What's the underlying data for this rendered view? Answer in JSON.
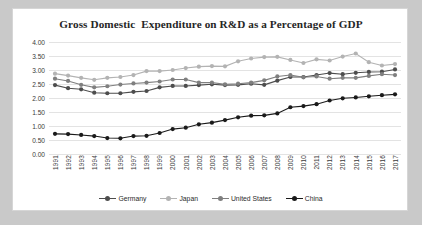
{
  "chart_data": {
    "type": "line",
    "title": "Gross Domestic  Expenditure on R&D as a Percentage of GDP",
    "xlabel": "",
    "ylabel": "",
    "ylim": [
      0,
      4
    ],
    "ytick_step": 0.5,
    "ytick_labels": [
      "4.00",
      "3.50",
      "3.00",
      "2.50",
      "2.00",
      "1.50",
      "1.00",
      "0.50",
      "0.00"
    ],
    "grid": true,
    "legend_position": "bottom",
    "categories": [
      "1991",
      "1992",
      "1993",
      "1994",
      "1995",
      "1996",
      "1997",
      "1998",
      "1999",
      "2000",
      "2001",
      "2002",
      "2003",
      "2004",
      "2005",
      "2006",
      "2007",
      "2008",
      "2009",
      "2010",
      "2011",
      "2012",
      "2013",
      "2014",
      "2015",
      "2016",
      "2017"
    ],
    "series": [
      {
        "name": "Germany",
        "color": "#4d4d4d",
        "values": [
          2.46,
          2.35,
          2.31,
          2.19,
          2.17,
          2.17,
          2.22,
          2.25,
          2.38,
          2.43,
          2.43,
          2.46,
          2.49,
          2.46,
          2.47,
          2.51,
          2.47,
          2.62,
          2.75,
          2.75,
          2.82,
          2.89,
          2.85,
          2.9,
          2.93,
          2.94,
          3.02
        ]
      },
      {
        "name": "Japan",
        "color": "#b3b3b3",
        "values": [
          2.87,
          2.8,
          2.72,
          2.65,
          2.72,
          2.75,
          2.82,
          2.96,
          2.96,
          3.0,
          3.07,
          3.12,
          3.14,
          3.13,
          3.31,
          3.41,
          3.46,
          3.47,
          3.36,
          3.25,
          3.38,
          3.34,
          3.48,
          3.59,
          3.28,
          3.16,
          3.21
        ]
      },
      {
        "name": "United States",
        "color": "#7f7f7f",
        "values": [
          2.69,
          2.61,
          2.47,
          2.38,
          2.42,
          2.48,
          2.52,
          2.55,
          2.59,
          2.66,
          2.66,
          2.55,
          2.55,
          2.49,
          2.51,
          2.55,
          2.63,
          2.77,
          2.82,
          2.74,
          2.77,
          2.69,
          2.72,
          2.72,
          2.79,
          2.85,
          2.82
        ]
      },
      {
        "name": "China",
        "color": "#1a1a1a",
        "values": [
          0.72,
          0.71,
          0.68,
          0.64,
          0.57,
          0.56,
          0.64,
          0.65,
          0.75,
          0.89,
          0.94,
          1.06,
          1.12,
          1.21,
          1.31,
          1.37,
          1.38,
          1.45,
          1.67,
          1.71,
          1.78,
          1.91,
          1.99,
          2.02,
          2.06,
          2.1,
          2.13
        ]
      }
    ]
  }
}
